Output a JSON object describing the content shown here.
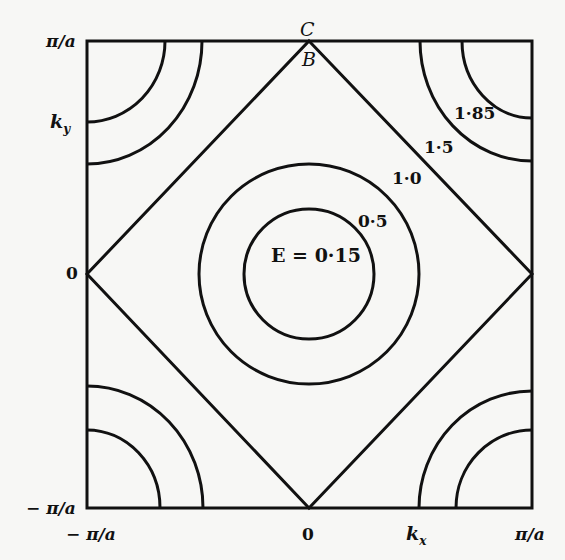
{
  "diagram": {
    "type": "constant-energy-contours",
    "axes": {
      "x_label": "k_x",
      "y_label": "k_y",
      "x_ticks": [
        "-π/a",
        "0",
        "π/a"
      ],
      "y_ticks": [
        "π/a",
        "0",
        "-π/a"
      ]
    },
    "points": {
      "top_outer": "C",
      "top_inner": "B"
    },
    "contours": [
      {
        "label": "E = 0·15",
        "shape": "circle"
      },
      {
        "label": "0·5",
        "shape": "circle"
      },
      {
        "label": "1·0",
        "shape": "diamond"
      },
      {
        "label": "1·5",
        "shape": "corner-arc"
      },
      {
        "label": "1·85",
        "shape": "corner-arc"
      }
    ]
  },
  "labels": {
    "y_top": "π/a",
    "y_ky": "k",
    "y_ky_sub": "y",
    "y_zero": "0",
    "y_bottom": "− π/a",
    "x_left": "− π/a",
    "x_zero": "0",
    "x_kx": "k",
    "x_kx_sub": "x",
    "x_right": "π/a",
    "point_c": "C",
    "point_b": "B",
    "e_015": "E = 0·15",
    "e_05": "0·5",
    "e_10": "1·0",
    "e_15": "1·5",
    "e_185": "1·85"
  }
}
